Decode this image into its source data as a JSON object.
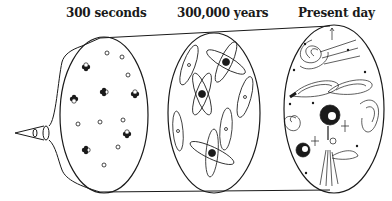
{
  "diagram": {
    "type": "cosmic-evolution-timeline",
    "stages": [
      {
        "label": "300 seconds",
        "description": "nuclei and free particles"
      },
      {
        "label": "300,000 years",
        "description": "atoms formed with orbiting electrons"
      },
      {
        "label": "Present day",
        "description": "galaxies, stars and structure"
      }
    ],
    "colors": {
      "ink": "#1a1a1a",
      "background": "#ffffff"
    }
  }
}
